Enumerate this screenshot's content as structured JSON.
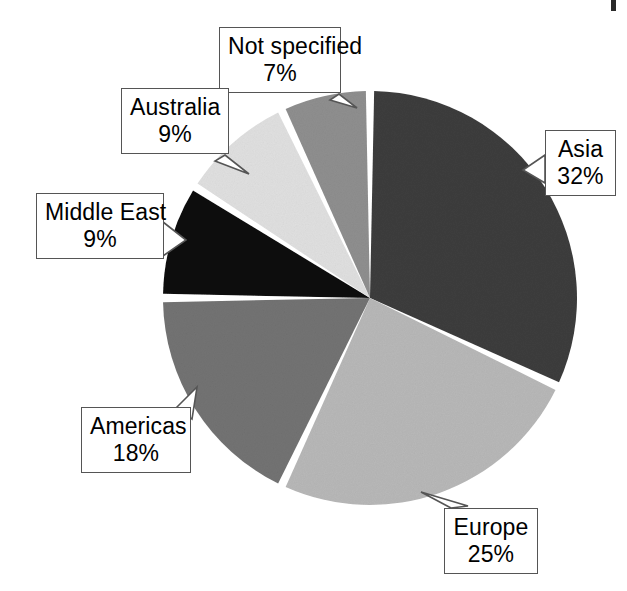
{
  "chart_data": {
    "type": "pie",
    "title": "",
    "subtitle": "",
    "xlabel": "",
    "ylabel": "",
    "legend_position": "none",
    "grid": false,
    "units": "percent",
    "total": 100,
    "start_angle_deg": 0,
    "direction": "clockwise",
    "categories": [
      "Asia",
      "Europe",
      "Americas",
      "Middle East",
      "Australia",
      "Not specified"
    ],
    "values": [
      32,
      25,
      18,
      9,
      9,
      7
    ],
    "value_labels": [
      "32%",
      "25%",
      "18%",
      "9%",
      "9%",
      "7%"
    ],
    "slice_colors": [
      "#3d3d3d",
      "#b8b8b8",
      "#737373",
      "#0a0a0a",
      "#e0e0e0",
      "#8f8f8f"
    ],
    "slices": [
      {
        "label": "Asia",
        "value": 32,
        "value_label": "32%",
        "color": "#3d3d3d"
      },
      {
        "label": "Europe",
        "value": 25,
        "value_label": "25%",
        "color": "#b8b8b8"
      },
      {
        "label": "Americas",
        "value": 18,
        "value_label": "18%",
        "color": "#737373"
      },
      {
        "label": "Middle East",
        "value": 9,
        "value_label": "9%",
        "color": "#0a0a0a"
      },
      {
        "label": "Australia",
        "value": 9,
        "value_label": "9%",
        "color": "#e0e0e0"
      },
      {
        "label": "Not specified",
        "value": 7,
        "value_label": "7%",
        "color": "#8f8f8f"
      }
    ]
  },
  "callouts": {
    "not_specified": {
      "name": "Not specified",
      "value": "7%"
    },
    "australia": {
      "name": "Australia",
      "value": "9%"
    },
    "middle_east": {
      "name": "Middle East",
      "value": "9%"
    },
    "americas": {
      "name": "Americas",
      "value": "18%"
    },
    "europe": {
      "name": "Europe",
      "value": "25%"
    },
    "asia": {
      "name": "Asia",
      "value": "32%"
    }
  },
  "style": {
    "background": "#ffffff",
    "separator_color": "#ffffff",
    "callout_border": "#555555",
    "text_color": "#000000"
  }
}
